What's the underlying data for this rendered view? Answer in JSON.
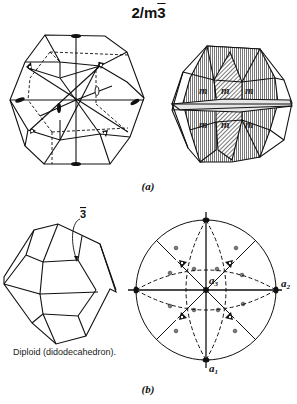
{
  "figure": {
    "title_main": "2/m",
    "title_bar": "3",
    "caption_a": "(a)",
    "caption_b": "(b)",
    "diploid_label": "Diploid (didodecahedron).",
    "rotoinversion_label": "3",
    "stereogram_axes": {
      "a1": "a",
      "a1_sub": "1",
      "a2": "a",
      "a2_sub": "2",
      "a3": "a",
      "a3_sub": "3"
    },
    "colors": {
      "line": "#111111",
      "hatch_fill": "#b8b8b8",
      "background": "#ffffff"
    }
  }
}
